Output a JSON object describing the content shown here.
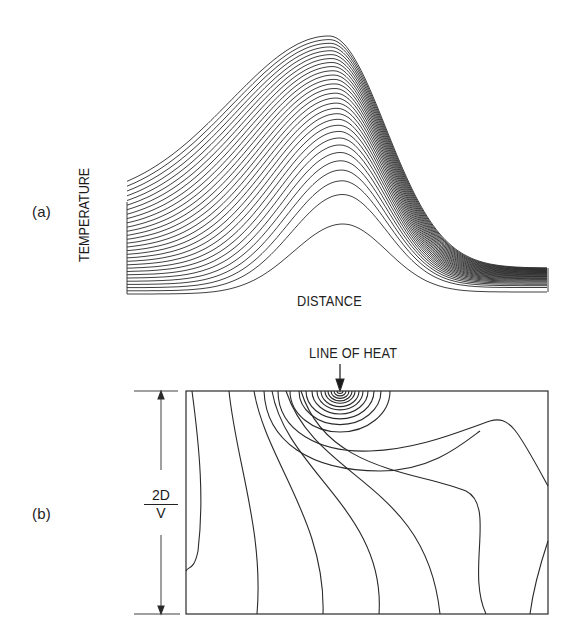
{
  "panel_a": {
    "label": "(a)",
    "ylabel": "TEMPERATURE",
    "xlabel": "DISTANCE",
    "curve_count": 30,
    "x_start": 127,
    "x_end": 548,
    "left_y_top": 202,
    "left_y_bottom": 294,
    "right_y_top": 268,
    "right_y_bottom": 292,
    "peak_x": 343,
    "peak_y_top": 36,
    "peak_y_bottom": 224,
    "baseline_y": 296
  },
  "panel_b": {
    "label": "(b)",
    "annotation": "LINE OF HEAT",
    "dimension_numerator": "2D",
    "dimension_denominator": "V",
    "box": {
      "x": 186,
      "y": 391,
      "width": 362,
      "height": 223
    },
    "heat_source_x": 340,
    "concentric_count": 11,
    "dimension_line_x": 161
  },
  "chart_data": [
    {
      "type": "line",
      "title": "(a)",
      "xlabel": "DISTANCE",
      "ylabel": "TEMPERATURE",
      "description": "Family of ~30 temperature-vs-distance profiles; each curve peaks near the same distance, with later curves higher and increasingly skewed, bunching tightly at the top and at the right tail.",
      "grid": false
    },
    {
      "type": "contour",
      "title": "(b)",
      "annotation": "LINE OF HEAT",
      "dimension": "2D/V",
      "description": "Isotherm contour map in a rectangular cross-section; concentric arcs around a line heat source on the top edge, transitioning into wavy near-vertical contours away from the source."
    }
  ]
}
